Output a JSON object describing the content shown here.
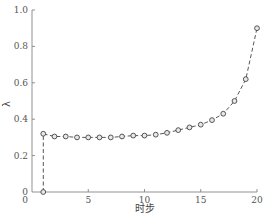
{
  "chart_data": {
    "type": "line",
    "title": "",
    "xlabel": "时步",
    "ylabel": "λ",
    "xlim": [
      0,
      20
    ],
    "ylim": [
      0,
      1.0
    ],
    "grid": false,
    "legend": null,
    "x_ticks": [
      0,
      5,
      10,
      15,
      20
    ],
    "y_ticks": [
      0,
      0.2,
      0.4,
      0.6,
      0.8,
      1.0
    ],
    "x_tick_labels": [
      "0",
      "5",
      "10",
      "15",
      "20"
    ],
    "y_tick_labels": [
      "0",
      "0.2",
      "0.4",
      "0.6",
      "0.8",
      "1.0"
    ],
    "series": [
      {
        "name": "λ",
        "line_style": "dashed",
        "marker": "circle",
        "color": "#444444",
        "x": [
          1,
          1,
          2,
          3,
          4,
          5,
          6,
          7,
          8,
          9,
          10,
          11,
          12,
          13,
          14,
          15,
          16,
          17,
          18,
          19,
          20
        ],
        "y": [
          0.0,
          0.32,
          0.305,
          0.305,
          0.3,
          0.3,
          0.3,
          0.3,
          0.305,
          0.31,
          0.31,
          0.315,
          0.325,
          0.34,
          0.355,
          0.37,
          0.395,
          0.43,
          0.5,
          0.62,
          0.9
        ]
      }
    ]
  },
  "labels": {
    "xlabel": "时步",
    "ylabel": "λ"
  }
}
